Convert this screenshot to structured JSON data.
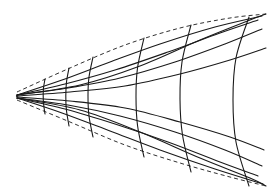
{
  "figure": {
    "title": "Geodesic wedge diagram",
    "type": "line-diagram",
    "canvas": {
      "width": 273,
      "height": 196
    },
    "background_color": "#ffffff",
    "ink_color": "#1a1a1a",
    "apex": {
      "x": 17,
      "y": 96,
      "label": "apex"
    },
    "stroke_widths": {
      "thin": 0.9,
      "medium": 1.1,
      "thick": 1.3
    },
    "dash_pattern": "4 3"
  },
  "chart_data": {
    "type": "line",
    "title": "Geodesic wedge diagram",
    "xlabel": "",
    "ylabel": "",
    "xlim": [
      0,
      273
    ],
    "ylim": [
      0,
      196
    ],
    "grid": false,
    "legend": "none",
    "apex": [
      17,
      96
    ],
    "boundaries": [
      {
        "name": "upper-dashed-boundary",
        "style": "dashed",
        "points": [
          [
            17,
            92
          ],
          [
            70,
            68
          ],
          [
            125,
            45
          ],
          [
            180,
            28
          ],
          [
            230,
            18
          ],
          [
            266,
            14
          ]
        ]
      },
      {
        "name": "lower-dashed-boundary",
        "style": "dashed",
        "points": [
          [
            17,
            100
          ],
          [
            70,
            122
          ],
          [
            125,
            145
          ],
          [
            180,
            163
          ],
          [
            230,
            177
          ],
          [
            266,
            186
          ]
        ]
      }
    ],
    "rays": [
      {
        "name": "ray-upper-1",
        "style": "solid",
        "points": [
          [
            17,
            95
          ],
          [
            62,
            80
          ],
          [
            110,
            62
          ],
          [
            160,
            44
          ],
          [
            215,
            27
          ],
          [
            262,
            16
          ]
        ]
      },
      {
        "name": "ray-upper-2",
        "style": "solid",
        "points": [
          [
            17,
            95
          ],
          [
            65,
            84
          ],
          [
            115,
            70
          ],
          [
            168,
            52
          ],
          [
            220,
            33
          ],
          [
            258,
            20
          ]
        ]
      },
      {
        "name": "ray-upper-3",
        "style": "solid",
        "points": [
          [
            17,
            95
          ],
          [
            68,
            88
          ],
          [
            120,
            78
          ],
          [
            175,
            62
          ],
          [
            225,
            44
          ],
          [
            262,
            29
          ]
        ]
      },
      {
        "name": "ray-mid-upper",
        "style": "solid",
        "points": [
          [
            17,
            96
          ],
          [
            70,
            92
          ],
          [
            125,
            86
          ],
          [
            180,
            74
          ],
          [
            230,
            60
          ],
          [
            266,
            48
          ]
        ]
      },
      {
        "name": "ray-mid-lower",
        "style": "solid",
        "points": [
          [
            17,
            97
          ],
          [
            70,
            101
          ],
          [
            125,
            108
          ],
          [
            180,
            122
          ],
          [
            230,
            137
          ],
          [
            264,
            150
          ]
        ]
      },
      {
        "name": "ray-lower-3",
        "style": "solid",
        "points": [
          [
            17,
            98
          ],
          [
            68,
            105
          ],
          [
            120,
            116
          ],
          [
            175,
            132
          ],
          [
            225,
            150
          ],
          [
            262,
            166
          ]
        ]
      },
      {
        "name": "ray-lower-2",
        "style": "solid",
        "points": [
          [
            17,
            98
          ],
          [
            65,
            109
          ],
          [
            115,
            124
          ],
          [
            168,
            142
          ],
          [
            220,
            162
          ],
          [
            258,
            176
          ]
        ]
      },
      {
        "name": "ray-lower-1",
        "style": "solid",
        "points": [
          [
            17,
            98
          ],
          [
            62,
            113
          ],
          [
            110,
            131
          ],
          [
            160,
            150
          ],
          [
            215,
            169
          ],
          [
            263,
            184
          ]
        ]
      }
    ],
    "meridians": [
      {
        "name": "meridian-1",
        "style": "solid",
        "x_at_axis": 44,
        "points": [
          [
            45,
            79
          ],
          [
            43.5,
            88
          ],
          [
            43.2,
            96
          ],
          [
            43.6,
            104
          ],
          [
            45,
            114
          ]
        ]
      },
      {
        "name": "meridian-2",
        "style": "solid",
        "x_at_axis": 66,
        "points": [
          [
            69,
            68
          ],
          [
            66.5,
            82
          ],
          [
            65.8,
            96
          ],
          [
            66.4,
            110
          ],
          [
            69,
            126
          ]
        ]
      },
      {
        "name": "meridian-3",
        "style": "solid",
        "x_at_axis": 88,
        "points": [
          [
            93,
            57
          ],
          [
            89,
            77
          ],
          [
            88,
            96
          ],
          [
            89,
            116
          ],
          [
            93,
            137
          ]
        ]
      },
      {
        "name": "meridian-4",
        "style": "solid",
        "x_at_axis": 136,
        "points": [
          [
            144,
            38
          ],
          [
            137.5,
            68
          ],
          [
            136,
            97
          ],
          [
            137.6,
            126
          ],
          [
            144,
            157
          ]
        ]
      },
      {
        "name": "meridian-5",
        "style": "solid",
        "x_at_axis": 180,
        "points": [
          [
            191,
            25
          ],
          [
            182,
            62
          ],
          [
            180,
            99
          ],
          [
            182.5,
            135
          ],
          [
            191,
            172
          ]
        ]
      },
      {
        "name": "meridian-6",
        "style": "solid",
        "x_at_axis": 233,
        "points": [
          [
            249,
            17
          ],
          [
            236,
            58
          ],
          [
            233,
            100
          ],
          [
            236,
            142
          ],
          [
            249,
            186
          ]
        ]
      }
    ],
    "crossing_arcs": [
      {
        "name": "crossing-arc-upper",
        "style": "solid",
        "points": [
          [
            17,
            95
          ],
          [
            80,
            85
          ],
          [
            140,
            66
          ],
          [
            200,
            40
          ],
          [
            250,
            20
          ],
          [
            266,
            14
          ]
        ]
      },
      {
        "name": "crossing-arc-lower",
        "style": "solid",
        "points": [
          [
            17,
            98
          ],
          [
            80,
            110
          ],
          [
            140,
            132
          ],
          [
            200,
            158
          ],
          [
            250,
            178
          ],
          [
            266,
            186
          ]
        ]
      }
    ]
  }
}
